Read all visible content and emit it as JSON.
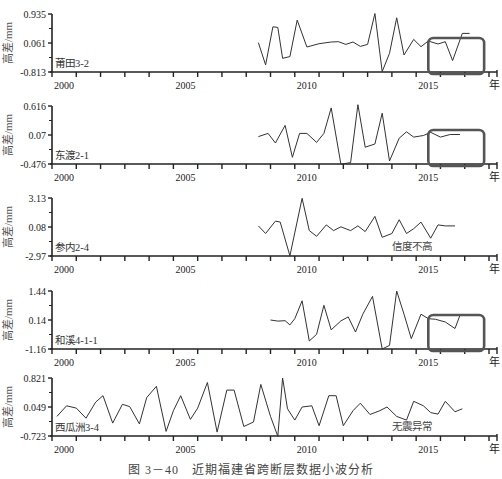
{
  "figure": {
    "caption": "图 3－40　近期福建省跨断层数据小波分析",
    "x_unit": "年",
    "y_label": "高差/mm",
    "line_color": "#333333",
    "box_color": "#555555"
  },
  "chart_data": [
    {
      "type": "line",
      "title": "莆田3-2",
      "xlabel": "年",
      "ylabel": "高差/mm",
      "yticks": [
        0.935,
        0.061,
        -0.813
      ],
      "ylim": [
        -0.813,
        0.935
      ],
      "xticks": [
        2000,
        2005,
        2010,
        2015
      ],
      "xlim": [
        2000,
        2018
      ],
      "annotation": "",
      "highlight_box": {
        "x_from": 2015.5,
        "x_to": 2017.8
      },
      "x": [
        2008.5,
        2008.8,
        2009.1,
        2009.3,
        2009.5,
        2009.8,
        2010.1,
        2010.5,
        2011.0,
        2011.5,
        2011.8,
        2012.1,
        2012.4,
        2012.7,
        2013.0,
        2013.3,
        2013.6,
        2013.9,
        2014.2,
        2014.5,
        2014.9,
        2015.2,
        2015.5,
        2015.9,
        2016.2,
        2016.5,
        2016.9,
        2017.2
      ],
      "values": [
        0.07,
        -0.6,
        0.55,
        0.53,
        -0.4,
        -0.35,
        0.75,
        -0.06,
        0.04,
        0.09,
        0.1,
        0.02,
        0.09,
        -0.04,
        0.02,
        0.95,
        -0.8,
        -0.25,
        0.82,
        -0.3,
        0.17,
        -0.05,
        0.12,
        0.03,
        0.1,
        -0.47,
        0.35,
        0.35
      ]
    },
    {
      "type": "line",
      "title": "东渡2-1",
      "xlabel": "年",
      "ylabel": "高差/mm",
      "yticks": [
        0.616,
        0.07,
        -0.476
      ],
      "ylim": [
        -0.476,
        0.616
      ],
      "xticks": [
        2000,
        2005,
        2010,
        2015
      ],
      "xlim": [
        2000,
        2018
      ],
      "annotation": "",
      "highlight_box": {
        "x_from": 2015.5,
        "x_to": 2017.8
      },
      "x": [
        2008.5,
        2008.9,
        2009.2,
        2009.6,
        2009.9,
        2010.2,
        2010.5,
        2010.9,
        2011.2,
        2011.5,
        2011.9,
        2012.3,
        2012.6,
        2012.9,
        2013.3,
        2013.6,
        2013.9,
        2014.3,
        2014.6,
        2014.9,
        2015.3,
        2015.6,
        2016.0,
        2016.4,
        2016.8
      ],
      "values": [
        0.04,
        0.1,
        -0.08,
        0.25,
        -0.35,
        0.1,
        0.1,
        -0.07,
        0.1,
        0.58,
        -0.48,
        -0.45,
        0.64,
        -0.16,
        -0.1,
        0.48,
        -0.42,
        0.01,
        0.13,
        0.03,
        0.06,
        0.12,
        0.03,
        0.08,
        0.08
      ]
    },
    {
      "type": "line",
      "title": "参内2-4",
      "xlabel": "年",
      "ylabel": "高差/mm",
      "yticks": [
        3.13,
        0.08,
        -2.97
      ],
      "ylim": [
        -2.97,
        3.13
      ],
      "xticks": [
        2000,
        2005,
        2010,
        2015
      ],
      "xlim": [
        2000,
        2018
      ],
      "annotation": "信度不高",
      "highlight_box": null,
      "x": [
        2008.5,
        2008.8,
        2009.2,
        2009.4,
        2009.8,
        2010.3,
        2010.6,
        2010.9,
        2011.3,
        2011.6,
        2011.9,
        2012.3,
        2012.6,
        2012.9,
        2013.3,
        2013.6,
        2014.0,
        2014.3,
        2014.6,
        2014.9,
        2015.2,
        2015.6,
        2015.9,
        2016.2,
        2016.6
      ],
      "values": [
        0.2,
        -0.6,
        0.7,
        0.6,
        -2.95,
        3.1,
        -0.3,
        -0.9,
        0.3,
        -0.3,
        0.1,
        -0.3,
        0.2,
        -0.4,
        1.2,
        -1.0,
        -0.6,
        0.85,
        -0.6,
        -0.1,
        0.6,
        -1.1,
        0.3,
        0.2,
        0.2
      ]
    },
    {
      "type": "line",
      "title": "和溪4-1-1",
      "xlabel": "年",
      "ylabel": "高差/mm",
      "yticks": [
        1.44,
        0.14,
        -1.16
      ],
      "ylim": [
        -1.16,
        1.44
      ],
      "xticks": [
        2000,
        2005,
        2010,
        2015
      ],
      "xlim": [
        2000,
        2018
      ],
      "annotation": "",
      "highlight_box": {
        "x_from": 2015.5,
        "x_to": 2017.8
      },
      "x": [
        2009.0,
        2009.3,
        2009.6,
        2009.8,
        2010.0,
        2010.3,
        2010.6,
        2010.9,
        2011.2,
        2011.5,
        2011.9,
        2012.2,
        2012.5,
        2012.8,
        2013.2,
        2013.6,
        2013.9,
        2014.2,
        2014.5,
        2014.8,
        2015.2,
        2015.5,
        2015.8,
        2016.2,
        2016.6,
        2016.8
      ],
      "values": [
        0.14,
        0.09,
        0.11,
        -0.08,
        0.2,
        1.0,
        -0.8,
        -0.5,
        0.8,
        -0.3,
        0.1,
        0.28,
        -0.4,
        0.4,
        1.2,
        -1.16,
        -1.0,
        1.44,
        0.4,
        -0.7,
        0.4,
        0.2,
        0.17,
        0.05,
        -0.24,
        0.34
      ]
    },
    {
      "type": "line",
      "title": "西瓜洲3-4",
      "xlabel": "年",
      "ylabel": "高差/mm",
      "yticks": [
        0.821,
        0.049,
        -0.723
      ],
      "ylim": [
        -0.723,
        0.821
      ],
      "xticks": [
        2000,
        2005,
        2010,
        2015
      ],
      "xlim": [
        2000,
        2018
      ],
      "annotation": "无震异常",
      "highlight_box": null,
      "x": [
        2000.2,
        2000.6,
        2001.0,
        2001.4,
        2001.8,
        2002.1,
        2002.5,
        2002.9,
        2003.2,
        2003.6,
        2003.9,
        2004.3,
        2004.7,
        2005.0,
        2005.3,
        2005.7,
        2006.0,
        2006.4,
        2006.8,
        2007.2,
        2007.5,
        2007.9,
        2008.3,
        2008.6,
        2009.0,
        2009.3,
        2009.5,
        2009.7,
        2010.0,
        2010.3,
        2010.7,
        2011.0,
        2011.4,
        2011.7,
        2012.0,
        2012.4,
        2012.7,
        2013.1,
        2013.5,
        2013.8,
        2014.2,
        2014.6,
        2014.9,
        2015.3,
        2015.6,
        2015.9,
        2016.2,
        2016.6,
        2016.9
      ],
      "values": [
        -0.2,
        0.08,
        0.02,
        -0.25,
        0.18,
        0.35,
        -0.38,
        0.12,
        0.06,
        -0.4,
        0.3,
        0.6,
        -0.6,
        -0.05,
        0.35,
        -0.28,
        0.02,
        0.7,
        -0.62,
        0.5,
        0.5,
        -0.47,
        -0.35,
        0.65,
        -0.2,
        -0.73,
        0.82,
        0.0,
        -0.3,
        0.05,
        0.08,
        -0.45,
        0.35,
        0.35,
        -0.45,
        -0.05,
        0.15,
        -0.15,
        -0.05,
        0.05,
        -0.2,
        -0.3,
        0.2,
        0.08,
        -0.1,
        -0.14,
        0.2,
        -0.08,
        0.0
      ]
    }
  ]
}
